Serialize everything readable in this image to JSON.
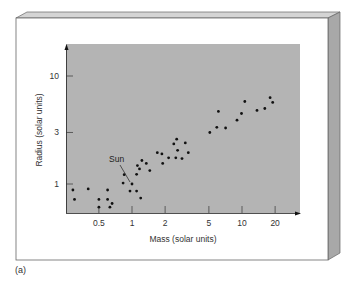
{
  "figure": {
    "panel_label": "(a)",
    "background_color": "#ffffff",
    "plot_bg_color": "#b4b4b4",
    "frame_side_color": "#a8a8a8",
    "frame_top_color": "#d4d4d4",
    "dot_color": "#111111"
  },
  "chart_data": {
    "type": "scatter",
    "title": "",
    "xlabel": "Mass (solar units)",
    "ylabel": "Radius (solar units)",
    "xscale": "log",
    "yscale": "log",
    "xticks": [
      0.5,
      1,
      2,
      5,
      10,
      20
    ],
    "xtick_labels": [
      "0.5",
      "1",
      "2",
      "5",
      "10",
      "20"
    ],
    "yticks": [
      1,
      3,
      10
    ],
    "ytick_labels": [
      "1",
      "3",
      "10"
    ],
    "xlim": [
      0.25,
      40
    ],
    "ylim": [
      0.5,
      30
    ],
    "grid": false,
    "legend": null,
    "annotations": [
      {
        "text": "Sun",
        "x": 1.0,
        "y": 1.0
      }
    ],
    "points": [
      {
        "x": 0.29,
        "y": 0.88
      },
      {
        "x": 0.3,
        "y": 0.72
      },
      {
        "x": 0.4,
        "y": 0.9
      },
      {
        "x": 0.5,
        "y": 0.72
      },
      {
        "x": 0.5,
        "y": 0.61
      },
      {
        "x": 0.6,
        "y": 0.88
      },
      {
        "x": 0.6,
        "y": 0.72
      },
      {
        "x": 0.63,
        "y": 0.61
      },
      {
        "x": 0.66,
        "y": 0.66
      },
      {
        "x": 0.83,
        "y": 1.02
      },
      {
        "x": 0.85,
        "y": 1.22
      },
      {
        "x": 0.96,
        "y": 0.86
      },
      {
        "x": 1.0,
        "y": 1.0
      },
      {
        "x": 1.1,
        "y": 1.23
      },
      {
        "x": 1.12,
        "y": 1.48
      },
      {
        "x": 1.1,
        "y": 0.86
      },
      {
        "x": 1.17,
        "y": 1.38
      },
      {
        "x": 1.2,
        "y": 0.74
      },
      {
        "x": 1.23,
        "y": 1.65
      },
      {
        "x": 1.35,
        "y": 1.55
      },
      {
        "x": 1.45,
        "y": 1.33
      },
      {
        "x": 1.7,
        "y": 1.95
      },
      {
        "x": 1.87,
        "y": 1.9
      },
      {
        "x": 1.9,
        "y": 1.55
      },
      {
        "x": 2.15,
        "y": 1.75
      },
      {
        "x": 2.4,
        "y": 2.35
      },
      {
        "x": 2.5,
        "y": 1.75
      },
      {
        "x": 2.55,
        "y": 2.6
      },
      {
        "x": 2.6,
        "y": 2.05
      },
      {
        "x": 2.85,
        "y": 1.72
      },
      {
        "x": 3.05,
        "y": 2.4
      },
      {
        "x": 3.25,
        "y": 1.95
      },
      {
        "x": 5.1,
        "y": 3.0
      },
      {
        "x": 5.9,
        "y": 3.35
      },
      {
        "x": 6.1,
        "y": 4.7
      },
      {
        "x": 7.1,
        "y": 3.3
      },
      {
        "x": 9.0,
        "y": 3.9
      },
      {
        "x": 9.9,
        "y": 4.5
      },
      {
        "x": 10.6,
        "y": 5.8
      },
      {
        "x": 13.7,
        "y": 4.8
      },
      {
        "x": 16.1,
        "y": 5.0
      },
      {
        "x": 18.0,
        "y": 6.3
      },
      {
        "x": 19.0,
        "y": 5.7
      }
    ]
  }
}
